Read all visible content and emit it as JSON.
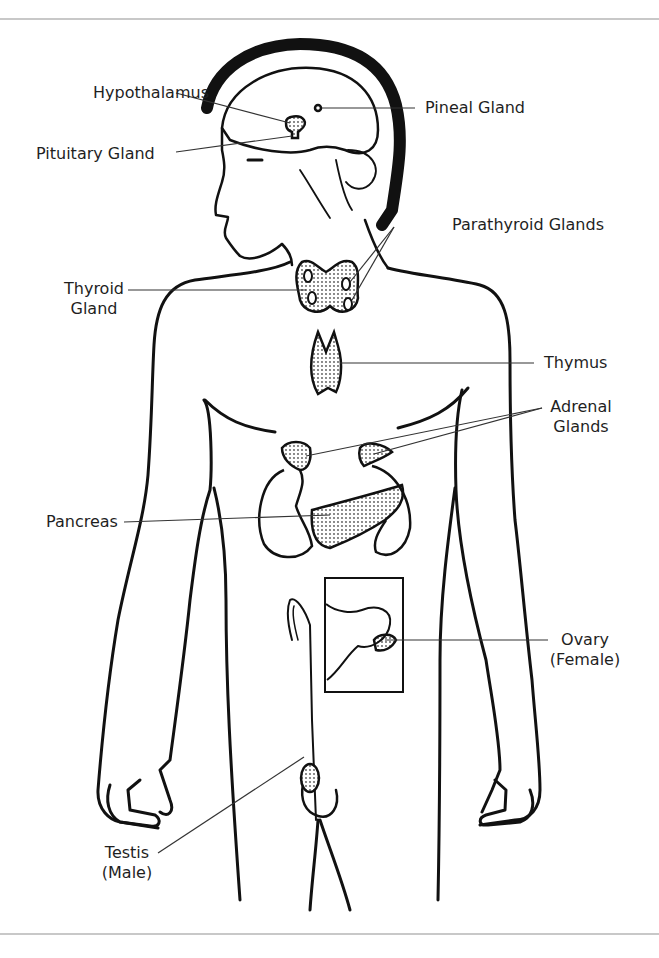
{
  "labels": {
    "hypothalamus": "Hypothalamus",
    "pineal": "Pineal Gland",
    "pituitary": "Pituitary Gland",
    "parathyroid": "Parathyroid Glands",
    "thyroid_line1": "Thyroid",
    "thyroid_line2": "Gland",
    "thymus": "Thymus",
    "adrenal_line1": "Adrenal",
    "adrenal_line2": "Glands",
    "pancreas": "Pancreas",
    "ovary_line1": "Ovary",
    "ovary_line2": "(Female)",
    "testis_line1": "Testis",
    "testis_line2": "(Male)"
  },
  "colors": {
    "ink": "#111111",
    "leader": "#333333",
    "rule": "#c8c8c8",
    "stipple": "#555555"
  }
}
